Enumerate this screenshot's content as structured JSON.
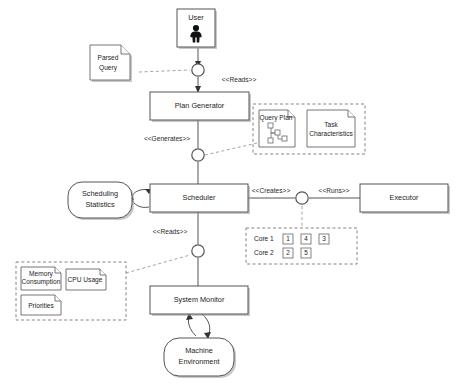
{
  "diagram": {
    "type": "uml-component-diagram",
    "background_color": "#ffffff",
    "line_color": "#555555",
    "dashed_line_color": "#999999"
  },
  "nodes": {
    "user": {
      "label": "User",
      "shape": "rectangle",
      "icon": "person-actor-icon"
    },
    "plan_generator": {
      "label": "Plan Generator",
      "shape": "rectangle"
    },
    "scheduler": {
      "label": "Scheduler",
      "shape": "rectangle"
    },
    "executor": {
      "label": "Executor",
      "shape": "rectangle"
    },
    "system_monitor": {
      "label": "System Monitor",
      "shape": "rectangle"
    },
    "scheduling_statistics": {
      "label_line1": "Scheduling",
      "label_line2": "Statistics",
      "shape": "rounded-rectangle"
    },
    "machine_environment": {
      "label_line1": "Machine",
      "label_line2": "Environment",
      "shape": "rounded-rectangle"
    }
  },
  "artifacts": {
    "parsed_query": {
      "label_line1": "Parsed",
      "label_line2": "Query",
      "shape": "document"
    },
    "query_plan": {
      "label": "Query Plan",
      "shape": "document",
      "graphic": "tree-graph"
    },
    "task_characteristics": {
      "label_line1": "Task",
      "label_line2": "Characteristics",
      "shape": "document"
    },
    "memory_consumption": {
      "label_line1": "Memory",
      "label_line2": "Consumption",
      "shape": "document"
    },
    "cpu_usage": {
      "label": "CPU Usage",
      "shape": "document"
    },
    "priorities": {
      "label": "Priorities",
      "shape": "document"
    }
  },
  "connectors": {
    "reads_plan": {
      "label": "<<Reads>>"
    },
    "generates": {
      "label": "<<Generates>>"
    },
    "creates": {
      "label": "<<Creates>>"
    },
    "runs": {
      "label": "<<Runs>>"
    },
    "reads_monitor": {
      "label": "<<Reads>>"
    }
  },
  "cores_panel": {
    "rows": [
      {
        "name": "Core 1",
        "slots": [
          "1",
          "4",
          "3"
        ]
      },
      {
        "name": "Core 2",
        "slots": [
          "2",
          "5"
        ]
      }
    ]
  }
}
